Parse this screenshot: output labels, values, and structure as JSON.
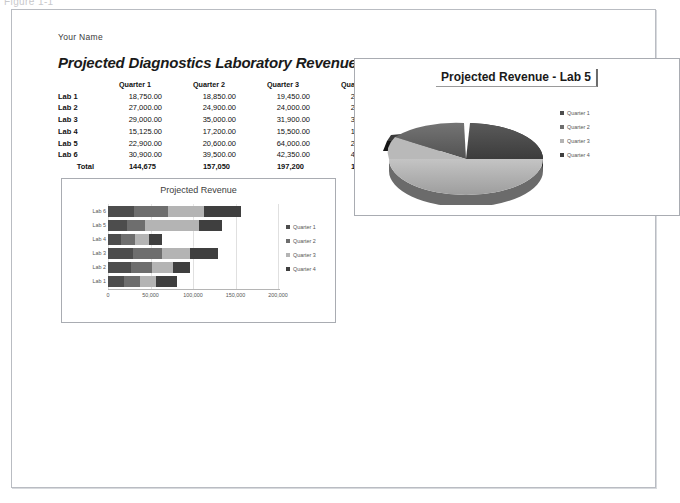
{
  "window": {
    "caption": "Figure 1-1"
  },
  "document": {
    "author_line": "Your Name",
    "title": "Projected Diagnostics Laboratory Revenue"
  },
  "table": {
    "corner_label": "",
    "headers": [
      "Quarter 1",
      "Quarter 2",
      "Quarter 3",
      "Quarter 4",
      "Total"
    ],
    "rows": [
      {
        "lab": "Lab 1",
        "q1": "18,750.00",
        "q2": "18,850.00",
        "q3": "19,450.00",
        "q4": "24,000.00",
        "total": "83,050"
      },
      {
        "lab": "Lab 2",
        "q1": "27,000.00",
        "q2": "24,900.00",
        "q3": "24,000.00",
        "q4": "20,500.00",
        "total": "96,400"
      },
      {
        "lab": "Lab 3",
        "q1": "29,000.00",
        "q2": "35,000.00",
        "q3": "31,900.00",
        "q4": "34,000.00",
        "total": "129,900"
      },
      {
        "lab": "Lab 4",
        "q1": "15,125.00",
        "q2": "17,200.00",
        "q3": "15,500.00",
        "q4": "16,100.00",
        "total": "63,925"
      },
      {
        "lab": "Lab 5",
        "q1": "22,900.00",
        "q2": "20,600.00",
        "q3": "64,000.00",
        "q4": "27,000.00",
        "total": "134,500"
      },
      {
        "lab": "Lab 6",
        "q1": "30,900.00",
        "q2": "39,500.00",
        "q3": "42,350.00",
        "q4": "43,400.00",
        "total": "156,150"
      }
    ],
    "total_row": {
      "label": "Total",
      "q1": "144,675",
      "q2": "157,050",
      "q3": "197,200",
      "q4": "165,000",
      "total": ""
    }
  },
  "bar_chart": {
    "title": "Projected Revenue",
    "legend": [
      "Quarter 1",
      "Quarter 2",
      "Quarter 3",
      "Quarter 4"
    ]
  },
  "pie_chart": {
    "title": "Projected Revenue - Lab 5",
    "legend": [
      "Quarter 1",
      "Quarter 2",
      "Quarter 3",
      "Quarter 4"
    ]
  },
  "colors": {
    "quarter1": "#4d4d4d",
    "quarter2": "#6e6e6e",
    "quarter3": "#b4b4b4",
    "quarter4": "#3f3f3f",
    "page_border": "#b9bcc2",
    "chart_border": "#a9acb2"
  },
  "chart_data": [
    {
      "type": "bar",
      "orientation": "horizontal",
      "stacked": true,
      "title": "Projected Revenue",
      "xlabel": "",
      "ylabel": "",
      "categories": [
        "Lab 1",
        "Lab 2",
        "Lab 3",
        "Lab 4",
        "Lab 5",
        "Lab 6"
      ],
      "series": [
        {
          "name": "Quarter 1",
          "values": [
            18750,
            27000,
            29000,
            15125,
            22900,
            30900
          ]
        },
        {
          "name": "Quarter 2",
          "values": [
            18850,
            24900,
            35000,
            17200,
            20600,
            39500
          ]
        },
        {
          "name": "Quarter 3",
          "values": [
            19450,
            24000,
            31900,
            15500,
            64000,
            42350
          ]
        },
        {
          "name": "Quarter 4",
          "values": [
            24000,
            20500,
            34000,
            16100,
            27000,
            43400
          ]
        }
      ],
      "xlim": [
        0,
        200000
      ],
      "xticks": [
        0,
        50000,
        100000,
        150000,
        200000
      ],
      "xticklabels": [
        "0",
        "50,000",
        "100,000",
        "150,000",
        "200,000"
      ],
      "grid": true,
      "legend_position": "right"
    },
    {
      "type": "pie",
      "title": "Projected Revenue - Lab 5",
      "labels": [
        "Quarter 1",
        "Quarter 2",
        "Quarter 3",
        "Quarter 4"
      ],
      "values": [
        22900,
        20600,
        64000,
        27000
      ],
      "exploded": true,
      "three_d": true,
      "legend_position": "right"
    }
  ]
}
